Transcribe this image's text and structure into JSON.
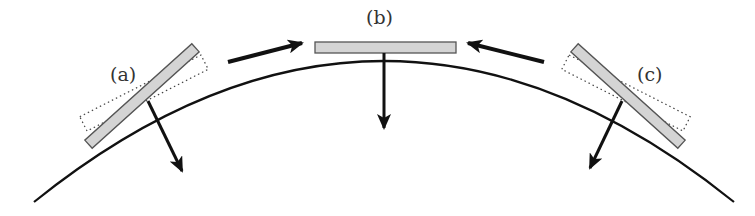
{
  "figure": {
    "labels": {
      "a": "(a)",
      "b": "(b)",
      "c": "(c)"
    },
    "colors": {
      "plate_fill": "#d4d4d4",
      "plate_stroke": "#555555",
      "line": "#111111",
      "dotted": "#444444"
    }
  }
}
